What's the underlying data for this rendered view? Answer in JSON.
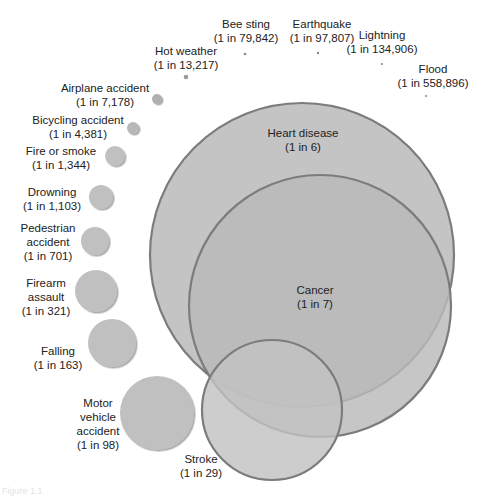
{
  "chart_data": {
    "type": "bubble",
    "title": "",
    "subtitle": "",
    "xlabel": "",
    "ylabel": "",
    "legend": null,
    "grid": false,
    "unit": "lifetime odds of death (1 in N)",
    "items": [
      {
        "name": "Heart disease",
        "odds_label": "(1 in 6)",
        "odds": 6,
        "cx": 302,
        "cy": 255,
        "r": 152,
        "fill": "#c4c4c4"
      },
      {
        "name": "Cancer",
        "odds_label": "(1 in 7)",
        "odds": 7,
        "cx": 320,
        "cy": 306,
        "r": 131,
        "fill": "#b9b9b9"
      },
      {
        "name": "Stroke",
        "odds_label": "(1 in 29)",
        "odds": 29,
        "cx": 272,
        "cy": 410,
        "r": 70,
        "fill": "#c2c2c2"
      },
      {
        "name": "Motor vehicle accident",
        "odds_label": "(1 in 98)",
        "odds": 98,
        "cx": 157,
        "cy": 413,
        "r": 37,
        "fill": "#c0c0c0"
      },
      {
        "name": "Falling",
        "odds_label": "(1 in 163)",
        "odds": 163,
        "cx": 112,
        "cy": 343,
        "r": 24,
        "fill": "#c0c0c0"
      },
      {
        "name": "Firearm assault",
        "odds_label": "(1 in 321)",
        "odds": 321,
        "cx": 96,
        "cy": 291,
        "r": 21,
        "fill": "#c0c0c0"
      },
      {
        "name": "Pedestrian accident",
        "odds_label": "(1 in 701)",
        "odds": 701,
        "cx": 95,
        "cy": 241,
        "r": 14,
        "fill": "#c0c0c0"
      },
      {
        "name": "Drowning",
        "odds_label": "(1 in 1,103)",
        "odds": 1103,
        "cx": 101,
        "cy": 197,
        "r": 12,
        "fill": "#c0c0c0"
      },
      {
        "name": "Fire or smoke",
        "odds_label": "(1 in 1,344)",
        "odds": 1344,
        "cx": 115,
        "cy": 156,
        "r": 10,
        "fill": "#c0c0c0"
      },
      {
        "name": "Bicycling accident",
        "odds_label": "(1 in 4,381)",
        "odds": 4381,
        "cx": 133,
        "cy": 128,
        "r": 6,
        "fill": "#b8b8b8"
      },
      {
        "name": "Airplane accident",
        "odds_label": "(1 in 7,178)",
        "odds": 7178,
        "cx": 157,
        "cy": 99,
        "r": 5,
        "fill": "#b0b0b0"
      },
      {
        "name": "Hot weather",
        "odds_label": "(1 in 13,217)",
        "odds": 13217,
        "cx": 186,
        "cy": 77,
        "r": 2.3,
        "fill": "#9a9a9a"
      },
      {
        "name": "Bee sting",
        "odds_label": "(1 in 79,842)",
        "odds": 79842,
        "cx": 245,
        "cy": 54,
        "r": 1.3,
        "fill": "#888888"
      },
      {
        "name": "Earthquake",
        "odds_label": "(1 in 97,807)",
        "odds": 97807,
        "cx": 318,
        "cy": 53,
        "r": 1.2,
        "fill": "#888888"
      },
      {
        "name": "Lightning",
        "odds_label": "(1 in 134,906)",
        "odds": 134906,
        "cx": 382,
        "cy": 64,
        "r": 1.1,
        "fill": "#888888"
      },
      {
        "name": "Flood",
        "odds_label": "(1 in 558,896)",
        "odds": 558896,
        "cx": 426,
        "cy": 96,
        "r": 1.0,
        "fill": "#888888"
      }
    ],
    "stroke_color": "#7c7c7c"
  },
  "labels": {
    "heart": {
      "line1": "Heart disease",
      "line2": "(1 in 6)"
    },
    "cancer": {
      "line1": "Cancer",
      "line2": "(1 in 7)"
    },
    "stroke": {
      "line1": "Stroke",
      "line2": "(1 in 29)"
    },
    "motor": {
      "line1": "Motor",
      "line2": "vehicle",
      "line3": "accident",
      "line4": "(1 in 98)"
    },
    "falling": {
      "line1": "Falling",
      "line2": "(1 in 163)"
    },
    "firearm": {
      "line1": "Firearm",
      "line2": "assault",
      "line3": "(1 in 321)"
    },
    "pedestrian": {
      "line1": "Pedestrian",
      "line2": "accident",
      "line3": "(1 in 701)"
    },
    "drowning": {
      "line1": "Drowning",
      "line2": "(1 in 1,103)"
    },
    "fire": {
      "line1": "Fire or smoke",
      "line2": "(1 in 1,344)"
    },
    "bicycling": {
      "line1": "Bicycling accident",
      "line2": "(1 in 4,381)"
    },
    "airplane": {
      "line1": "Airplane accident",
      "line2": "(1 in 7,178)"
    },
    "hot": {
      "line1": "Hot weather",
      "line2": "(1 in 13,217)"
    },
    "bee": {
      "line1": "Bee sting",
      "line2": "(1 in 79,842)"
    },
    "quake": {
      "line1": "Earthquake",
      "line2": "(1 in 97,807)"
    },
    "lightning": {
      "line1": "Lightning",
      "line2": "(1 in 134,906)"
    },
    "flood": {
      "line1": "Flood",
      "line2": "(1 in 558,896)"
    }
  },
  "caption": "Figure 1.1"
}
